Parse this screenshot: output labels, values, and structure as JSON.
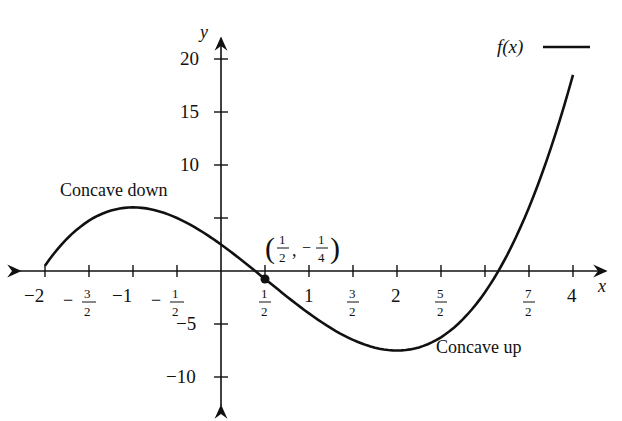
{
  "chart_data": {
    "type": "line",
    "title": "",
    "xlabel": "x",
    "ylabel": "y",
    "xlim": [
      -2,
      4
    ],
    "ylim": [
      -10,
      20
    ],
    "x_ticks": [
      -2,
      -1.5,
      -1,
      -0.5,
      0.5,
      1,
      1.5,
      2,
      2.5,
      3.5,
      4
    ],
    "x_tick_labels": [
      "−2",
      "−3/2",
      "−1",
      "−1/2",
      "1/2",
      "1",
      "3/2",
      "2",
      "5/2",
      "7/2",
      "4"
    ],
    "y_ticks": [
      -10,
      -5,
      5,
      10,
      15,
      20
    ],
    "y_tick_labels": [
      "−10",
      "−5",
      "",
      "10",
      "15",
      "20"
    ],
    "grid": false,
    "legend_position": "top-right",
    "series": [
      {
        "name": "f(x)",
        "x": [
          -2,
          -1.5,
          -1,
          -0.5,
          0,
          0.5,
          1,
          1.5,
          2,
          2.5,
          3,
          3.5,
          4
        ],
        "values": [
          0.5,
          4.25,
          6,
          5.25,
          2.5,
          -0.75,
          -4,
          -6.25,
          -7.5,
          -6.75,
          -2,
          4.5,
          18.5
        ]
      }
    ],
    "annotations": [
      {
        "text": "Concave down",
        "x": -1,
        "y": 7.5
      },
      {
        "text": "Concave up",
        "x": 2.6,
        "y": -7.5
      },
      {
        "text": "(1/2, −1/4)",
        "x": 0.5,
        "y": -0.25,
        "marker": "point"
      }
    ]
  },
  "labels": {
    "x_axis": "x",
    "y_axis": "y",
    "legend": "f(x)",
    "concave_down": "Concave down",
    "concave_up": "Concave up",
    "y20": "20",
    "y15": "15",
    "y10": "10",
    "ym5": "−5",
    "ym10": "−10",
    "xm2": "−2",
    "xm1": "−1",
    "x1": "1",
    "x2": "2",
    "x4": "4",
    "minus": "−",
    "one": "1",
    "two": "2",
    "three": "3",
    "four": "4",
    "five": "5",
    "seven": "7"
  }
}
